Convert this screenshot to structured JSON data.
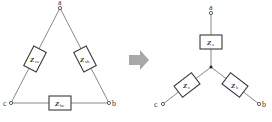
{
  "diagram": {
    "delta": {
      "nodes": [
        {
          "id": "a",
          "label": "a"
        },
        {
          "id": "b",
          "label": "b"
        },
        {
          "id": "c",
          "label": "c"
        }
      ],
      "impedances": [
        {
          "id": "Zca",
          "symbol": "Z",
          "subscript": "ca",
          "between": [
            "c",
            "a"
          ]
        },
        {
          "id": "Zab",
          "symbol": "Z",
          "subscript": "ab",
          "between": [
            "a",
            "b"
          ]
        },
        {
          "id": "Zbc",
          "symbol": "Z",
          "subscript": "bc",
          "between": [
            "b",
            "c"
          ]
        }
      ]
    },
    "arrow": {
      "direction": "right",
      "color": "#a8a8a8"
    },
    "star": {
      "nodes": [
        {
          "id": "a",
          "label": "a"
        },
        {
          "id": "b",
          "label": "b"
        },
        {
          "id": "c",
          "label": "c"
        }
      ],
      "impedances": [
        {
          "id": "Za",
          "symbol": "Z",
          "subscript": "a",
          "terminal": "a"
        },
        {
          "id": "Zb",
          "symbol": "Z",
          "subscript": "b",
          "terminal": "b"
        },
        {
          "id": "Zc",
          "symbol": "Z",
          "subscript": "c",
          "terminal": "c"
        }
      ]
    },
    "colors": {
      "line": "#6a6a6a",
      "box_border": "#3a3a3a",
      "text": "#333333",
      "arrow": "#a8a8a8"
    }
  }
}
